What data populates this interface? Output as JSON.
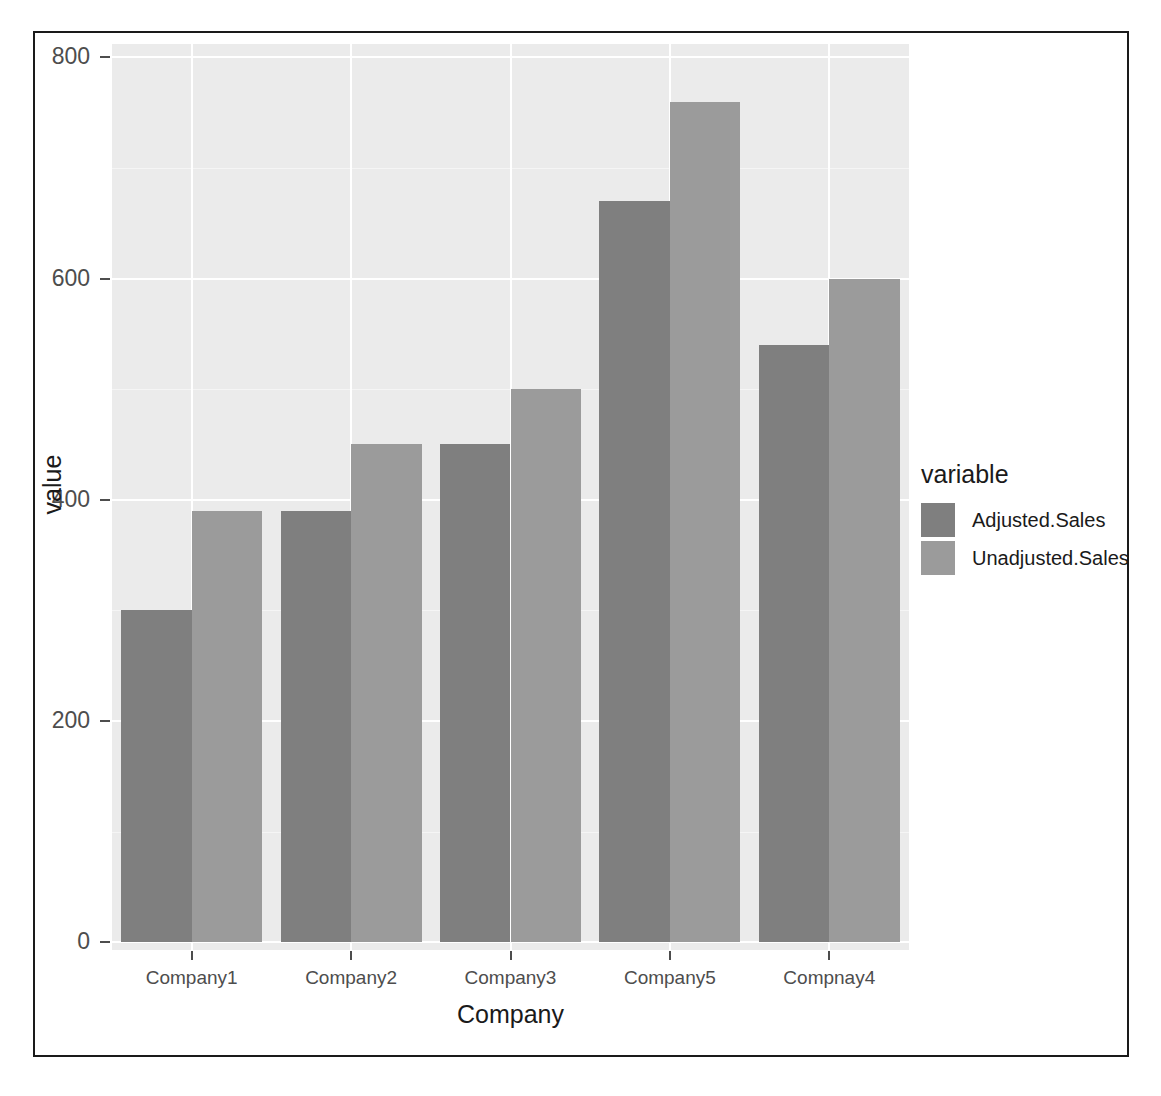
{
  "chart_data": {
    "type": "bar",
    "title": "",
    "subtitle": "",
    "xlabel": "Company",
    "ylabel": "value",
    "categories": [
      "Company1",
      "Company2",
      "Company3",
      "Company5",
      "Compnay4"
    ],
    "series": [
      {
        "name": "Adjusted.Sales",
        "color": "#7f7f7f",
        "values": [
          300,
          390,
          450,
          670,
          540
        ]
      },
      {
        "name": "Unadjusted.Sales",
        "color": "#9b9b9b",
        "values": [
          390,
          450,
          500,
          760,
          600
        ]
      }
    ],
    "legend": {
      "title": "variable",
      "position": "right",
      "entries": [
        "Adjusted.Sales",
        "Unadjusted.Sales"
      ]
    },
    "ylim": [
      0,
      800
    ],
    "yticks": [
      0,
      200,
      400,
      600,
      800
    ],
    "ytick_labels": [
      "0",
      "200",
      "400",
      "600",
      "800"
    ],
    "grid": true,
    "panel_background": "#ebebeb",
    "gridline_color": "#ffffff",
    "bar_mode": "grouped"
  },
  "axes": {
    "y_title": "value",
    "x_title": "Company"
  }
}
